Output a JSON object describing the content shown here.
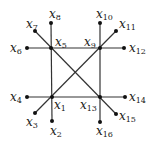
{
  "diagram": {
    "edge_color": "#333333",
    "node_color": "#111111",
    "nodes": [
      {
        "id": "x1",
        "sub": "1",
        "x": 52,
        "y": 97,
        "lx": 54,
        "ly": 99
      },
      {
        "id": "x2",
        "sub": "2",
        "x": 52,
        "y": 121,
        "lx": 50,
        "ly": 125
      },
      {
        "id": "x3",
        "sub": "3",
        "x": 35,
        "y": 113,
        "lx": 26,
        "ly": 116
      },
      {
        "id": "x4",
        "sub": "4",
        "x": 27,
        "y": 97,
        "lx": 10,
        "ly": 91
      },
      {
        "id": "x5",
        "sub": "5",
        "x": 51,
        "y": 48,
        "lx": 55,
        "ly": 36
      },
      {
        "id": "x6",
        "sub": "6",
        "x": 27,
        "y": 48,
        "lx": 10,
        "ly": 42
      },
      {
        "id": "x7",
        "sub": "7",
        "x": 35,
        "y": 31,
        "lx": 26,
        "ly": 18
      },
      {
        "id": "x8",
        "sub": "8",
        "x": 51,
        "y": 23,
        "lx": 49,
        "ly": 8
      },
      {
        "id": "x9",
        "sub": "9",
        "x": 100,
        "y": 48,
        "lx": 84,
        "ly": 36
      },
      {
        "id": "x10",
        "sub": "10",
        "x": 100,
        "y": 23,
        "lx": 96,
        "ly": 8
      },
      {
        "id": "x11",
        "sub": "11",
        "x": 116,
        "y": 31,
        "lx": 119,
        "ly": 18
      },
      {
        "id": "x12",
        "sub": "12",
        "x": 124,
        "y": 48,
        "lx": 129,
        "ly": 42
      },
      {
        "id": "x13",
        "sub": "13",
        "x": 100,
        "y": 97,
        "lx": 80,
        "ly": 99
      },
      {
        "id": "x14",
        "sub": "14",
        "x": 125,
        "y": 97,
        "lx": 129,
        "ly": 91
      },
      {
        "id": "x15",
        "sub": "15",
        "x": 116,
        "y": 114,
        "lx": 119,
        "ly": 110
      },
      {
        "id": "x16",
        "sub": "16",
        "x": 100,
        "y": 122,
        "lx": 96,
        "ly": 125
      }
    ],
    "edges": [
      [
        "x6",
        "x12"
      ],
      [
        "x4",
        "x14"
      ],
      [
        "x8",
        "x2"
      ],
      [
        "x10",
        "x16"
      ],
      [
        "x7",
        "x15"
      ],
      [
        "x3",
        "x11"
      ]
    ]
  }
}
